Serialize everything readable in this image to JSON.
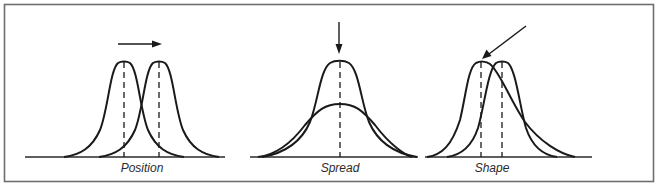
{
  "figure": {
    "panels": [
      {
        "id": "position",
        "label": "Position",
        "annotation": "arrow pointing right: shift in central location"
      },
      {
        "id": "spread",
        "label": "Spread",
        "annotation": "arrow pointing down at peak: same center, different variance"
      },
      {
        "id": "shape",
        "label": "Shape",
        "annotation": "arrow pointing at skewed peak: different skewness"
      }
    ],
    "colors": {
      "ink": "#1a1a1a",
      "frame": "#6e6e6e",
      "background": "#ffffff"
    }
  }
}
